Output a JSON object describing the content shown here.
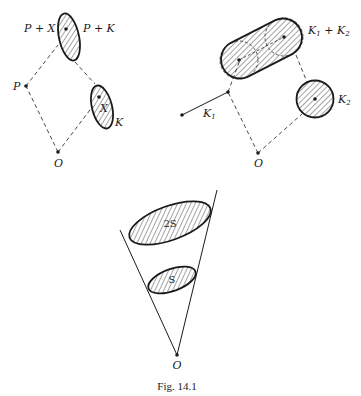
{
  "figure": {
    "caption": "Fig. 14.1",
    "colors": {
      "ink": "#1a1a1a",
      "background": "#ffffff"
    }
  },
  "left_diagram": {
    "labels": {
      "p_plus_x": "P + X",
      "p_plus_k": "P + K",
      "p": "P",
      "x": "X",
      "k": "K",
      "o": "O"
    }
  },
  "right_diagram": {
    "labels": {
      "k1_plus_k2": "K",
      "k1_plus_k2_sub1": "1",
      "k1_plus_k2_plus": " + K",
      "k1_plus_k2_sub2": "2",
      "k1": "K",
      "k1_sub": "1",
      "k2": "K",
      "k2_sub": "2",
      "o": "O"
    }
  },
  "bottom_diagram": {
    "labels": {
      "big_set": "2S",
      "small_set": "S",
      "o": "O"
    }
  }
}
